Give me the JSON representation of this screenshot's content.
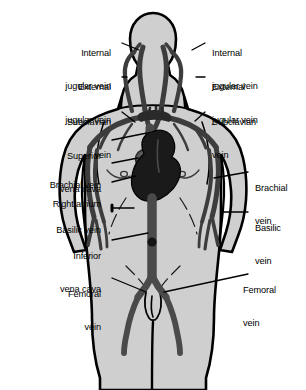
{
  "diagram": {
    "background_color": "#ffffff",
    "body_fill_color": "#cfcfcf",
    "body_outline_color": "#000000",
    "vein_color": "#4a4a4a",
    "vein_dark_color": "#262626",
    "heart_color": "#1a1a1a",
    "leader_color": "#000000",
    "text_color": "#000000"
  },
  "labels": {
    "left": [
      {
        "id": "internal-jugular-vein-left",
        "line1": "Internal",
        "line2": "jugular vein"
      },
      {
        "id": "external-jugular-vein-left",
        "line1": "External",
        "line2": "jugular vein"
      },
      {
        "id": "subclavian-vein-left",
        "line1": "Subclavian",
        "line2": "vein"
      },
      {
        "id": "superior-vena-cava",
        "line1": "Superior",
        "line2": "vena cava"
      },
      {
        "id": "brachial-vein-left",
        "line1": "Brachial vein",
        "line2": ""
      },
      {
        "id": "right-atrium",
        "line1": "Right atrium",
        "line2": ""
      },
      {
        "id": "basilic-vein-left",
        "line1": "Basilic vein",
        "line2": ""
      },
      {
        "id": "inferior-vena-cava",
        "line1": "Inferior",
        "line2": "vena cava"
      },
      {
        "id": "femoral-vein-left",
        "line1": "Femoral",
        "line2": "vein"
      }
    ],
    "right": [
      {
        "id": "internal-jugular-vein-right",
        "line1": "Internal",
        "line2": "jugular vein"
      },
      {
        "id": "external-jugular-vein-right",
        "line1": "External",
        "line2": "jugular vein"
      },
      {
        "id": "subclavian-vein-right",
        "line1": "Subclavian",
        "line2": "vein"
      },
      {
        "id": "brachial-vein-right",
        "line1": "Brachial",
        "line2": "vein"
      },
      {
        "id": "basilic-vein-right",
        "line1": "Basilic",
        "line2": "vein"
      },
      {
        "id": "femoral-vein-right",
        "line1": "Femoral",
        "line2": "vein"
      }
    ]
  }
}
